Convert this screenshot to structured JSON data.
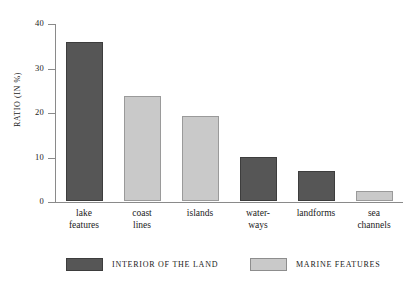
{
  "chart_data": {
    "type": "bar",
    "title": "",
    "subtitle": "",
    "xlabel": "",
    "ylabel": "RATIO (in %)",
    "ylim": [
      0,
      40
    ],
    "ytick_labels": [
      "0",
      "10",
      "20",
      "30",
      "40"
    ],
    "ytick_values": [
      0,
      10,
      20,
      30,
      40
    ],
    "grid": false,
    "legend_position": "bottom",
    "categories": [
      "lake features",
      "coast lines",
      "islands",
      "water-ways",
      "landforms",
      "sea channels"
    ],
    "category_lines": [
      [
        "lake",
        "features"
      ],
      [
        "coast",
        "lines"
      ],
      [
        "islands",
        ""
      ],
      [
        "water-",
        "ways"
      ],
      [
        "landforms",
        ""
      ],
      [
        "sea",
        "channels"
      ]
    ],
    "values": [
      35.7,
      23.7,
      19.2,
      10.0,
      6.7,
      2.3
    ],
    "point_series": [
      "INTERIOR OF THE LAND",
      "MARINE FEATURES",
      "MARINE FEATURES",
      "INTERIOR OF THE LAND",
      "INTERIOR OF THE LAND",
      "MARINE FEATURES"
    ],
    "series": [
      {
        "name": "INTERIOR OF THE LAND",
        "key": "interior",
        "color": "#565656",
        "values": [
          35.7,
          null,
          null,
          10.0,
          6.7,
          null
        ]
      },
      {
        "name": "MARINE FEATURES",
        "key": "marine",
        "color": "#c9c9c9",
        "values": [
          null,
          23.7,
          19.2,
          null,
          null,
          2.3
        ]
      }
    ]
  },
  "legend": {
    "items": [
      {
        "label": "INTERIOR OF THE LAND",
        "key": "interior",
        "color": "#565656"
      },
      {
        "label": "MARINE FEATURES",
        "key": "marine",
        "color": "#c9c9c9"
      }
    ]
  },
  "colors": {
    "background": "#ffffff",
    "axis": "#8a8a8a",
    "text": "#1a1a1a",
    "series_interior": "#565656",
    "series_marine": "#c9c9c9"
  }
}
